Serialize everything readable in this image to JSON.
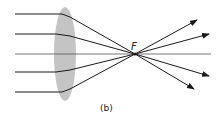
{
  "diagram": {
    "focal_label": "F",
    "caption": "(b)",
    "colors": {
      "ray": "#1a1a1a",
      "lens": "#c4c4c4",
      "axis": "#555555"
    },
    "lens": {
      "cx": 65,
      "cy": 54,
      "rx": 11,
      "ry": 47
    },
    "focal_point": {
      "x": 135,
      "y": 54
    },
    "rays": [
      {
        "y_in": 14,
        "exit": [
          197,
          20
        ]
      },
      {
        "y_in": 34,
        "exit": [
          209,
          34
        ]
      },
      {
        "y_in": 54,
        "exit": [
          211,
          54
        ]
      },
      {
        "y_in": 72,
        "exit": [
          209,
          76
        ]
      },
      {
        "y_in": 92,
        "exit": [
          194,
          89
        ]
      }
    ]
  }
}
